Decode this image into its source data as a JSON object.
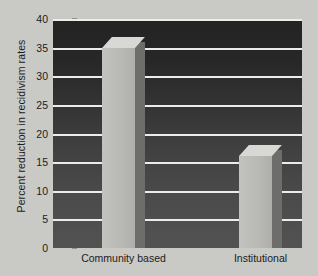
{
  "chart_data": {
    "type": "bar",
    "title": "",
    "xlabel": "",
    "ylabel": "Percent reduction in recidivism rates",
    "categories": [
      "Community based",
      "Institutional"
    ],
    "values": [
      35,
      16
    ],
    "ylim": [
      0,
      40
    ],
    "y_ticks": [
      0,
      5,
      10,
      15,
      20,
      25,
      30,
      35,
      40
    ],
    "y_tick_labels": [
      "0",
      "5",
      "10",
      "15",
      "20",
      "25",
      "30",
      "35",
      "40"
    ],
    "grid": true,
    "legend": false,
    "legend_position": "none",
    "style": {
      "plot_background_top": "#232323",
      "plot_background_bottom": "#525252",
      "gridline_color": "#ececeb",
      "bar_face_color": "#b9b9b6",
      "bar_side_color": "#6d6d6b",
      "bar_top_color": "#d8d8d5",
      "page_background": "#c9c9c6",
      "text_color": "#1c1c1c",
      "three_d": true
    }
  }
}
